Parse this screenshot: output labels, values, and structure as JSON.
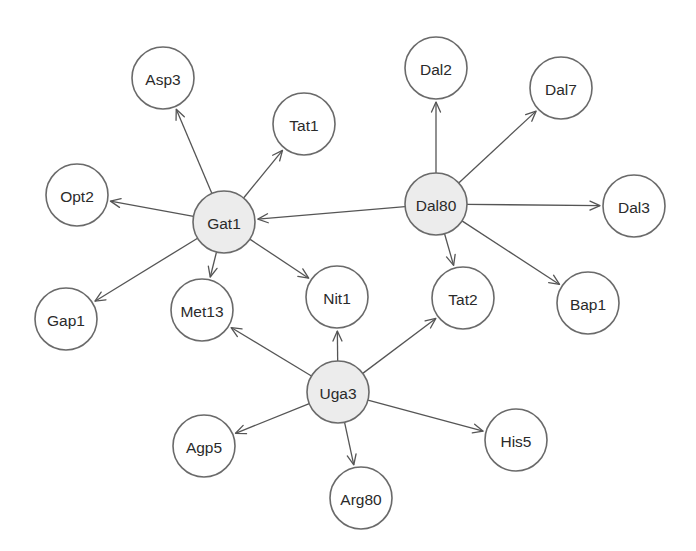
{
  "diagram": {
    "type": "directed-network",
    "colors": {
      "hub_fill": "#ececec",
      "leaf_fill": "#ffffff",
      "stroke": "#6a6a6a",
      "edge": "#555555"
    },
    "node_radius": 31,
    "nodes": [
      {
        "id": "Gat1",
        "label": "Gat1",
        "x": 224,
        "y": 222,
        "hub": true
      },
      {
        "id": "Dal80",
        "label": "Dal80",
        "x": 436,
        "y": 204,
        "hub": true
      },
      {
        "id": "Uga3",
        "label": "Uga3",
        "x": 338,
        "y": 392,
        "hub": true
      },
      {
        "id": "Asp3",
        "label": "Asp3",
        "x": 163,
        "y": 78,
        "hub": false
      },
      {
        "id": "Tat1",
        "label": "Tat1",
        "x": 304,
        "y": 124,
        "hub": false
      },
      {
        "id": "Opt2",
        "label": "Opt2",
        "x": 77,
        "y": 195,
        "hub": false
      },
      {
        "id": "Gap1",
        "label": "Gap1",
        "x": 66,
        "y": 319,
        "hub": false
      },
      {
        "id": "Met13",
        "label": "Met13",
        "x": 202,
        "y": 310,
        "hub": false
      },
      {
        "id": "Nit1",
        "label": "Nit1",
        "x": 337,
        "y": 297,
        "hub": false
      },
      {
        "id": "Dal2",
        "label": "Dal2",
        "x": 436,
        "y": 68,
        "hub": false
      },
      {
        "id": "Dal7",
        "label": "Dal7",
        "x": 561,
        "y": 88,
        "hub": false
      },
      {
        "id": "Dal3",
        "label": "Dal3",
        "x": 634,
        "y": 206,
        "hub": false
      },
      {
        "id": "Tat2",
        "label": "Tat2",
        "x": 463,
        "y": 298,
        "hub": false
      },
      {
        "id": "Bap1",
        "label": "Bap1",
        "x": 588,
        "y": 303,
        "hub": false
      },
      {
        "id": "Agp5",
        "label": "Agp5",
        "x": 204,
        "y": 446,
        "hub": false
      },
      {
        "id": "His5",
        "label": "His5",
        "x": 516,
        "y": 440,
        "hub": false
      },
      {
        "id": "Arg80",
        "label": "Arg80",
        "x": 361,
        "y": 498,
        "hub": false
      }
    ],
    "edges": [
      {
        "from": "Gat1",
        "to": "Asp3"
      },
      {
        "from": "Gat1",
        "to": "Tat1"
      },
      {
        "from": "Gat1",
        "to": "Opt2"
      },
      {
        "from": "Gat1",
        "to": "Gap1"
      },
      {
        "from": "Gat1",
        "to": "Met13"
      },
      {
        "from": "Gat1",
        "to": "Nit1"
      },
      {
        "from": "Dal80",
        "to": "Gat1"
      },
      {
        "from": "Dal80",
        "to": "Dal2"
      },
      {
        "from": "Dal80",
        "to": "Dal7"
      },
      {
        "from": "Dal80",
        "to": "Dal3"
      },
      {
        "from": "Dal80",
        "to": "Tat2"
      },
      {
        "from": "Dal80",
        "to": "Bap1"
      },
      {
        "from": "Uga3",
        "to": "Met13"
      },
      {
        "from": "Uga3",
        "to": "Nit1"
      },
      {
        "from": "Uga3",
        "to": "Tat2"
      },
      {
        "from": "Uga3",
        "to": "Agp5"
      },
      {
        "from": "Uga3",
        "to": "Arg80"
      },
      {
        "from": "Uga3",
        "to": "His5"
      }
    ]
  }
}
